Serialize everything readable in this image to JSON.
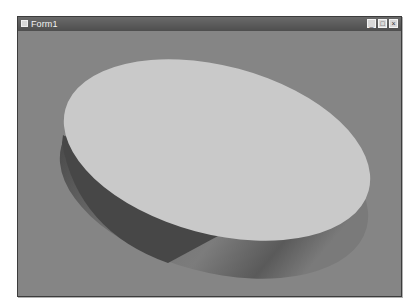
{
  "window": {
    "title": "Form1",
    "icon": "app-icon",
    "controls": {
      "minimize": {
        "icon": "minimize-icon",
        "glyph": "_"
      },
      "maximize": {
        "icon": "maximize-icon",
        "glyph": "□"
      },
      "close": {
        "icon": "close-icon",
        "glyph": "×"
      }
    }
  },
  "scene": {
    "object": "3D elliptical cylinder (disc) rendered in viewport",
    "colors": {
      "background": "#858585",
      "top_face": "#c9c9c9",
      "side_light": "#9a9a9a",
      "side_dark": "#4a4a4a"
    }
  }
}
